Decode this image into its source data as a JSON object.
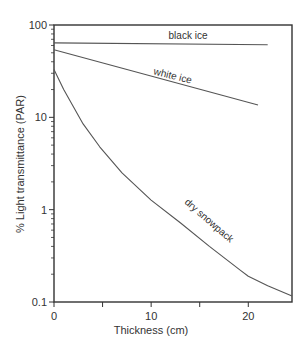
{
  "chart_data": {
    "type": "line",
    "title": "",
    "xlabel": "Thickness (cm)",
    "ylabel": "% Light transmittance (PAR)",
    "xlim": [
      0,
      24.5
    ],
    "ylim": [
      0.1,
      100
    ],
    "yscale": "log",
    "grid": false,
    "legend": "inline labels",
    "x_ticks": [
      0,
      10,
      20
    ],
    "x_minor_ticks": [
      5,
      15
    ],
    "y_ticks": [
      0.1,
      1,
      10,
      100
    ],
    "y_tick_labels": [
      "0.1",
      "1",
      "10",
      "100"
    ],
    "series": [
      {
        "name": "black ice",
        "x": [
          0,
          22
        ],
        "values": [
          64,
          61
        ]
      },
      {
        "name": "white ice",
        "x": [
          0,
          21
        ],
        "values": [
          54,
          13.6
        ]
      },
      {
        "name": "dry snowpack",
        "x": [
          0,
          1,
          2,
          3,
          4.7,
          7,
          10,
          13,
          16,
          19.2,
          20,
          22,
          24.5
        ],
        "values": [
          33,
          20,
          13,
          8.5,
          4.8,
          2.5,
          1.27,
          0.72,
          0.4,
          0.22,
          0.19,
          0.15,
          0.116
        ]
      }
    ]
  },
  "labels": {
    "xlabel": "Thickness (cm)",
    "ylabel": "% Light transmittance (PAR)",
    "black_ice": "black ice",
    "white_ice": "white ice",
    "dry_snowpack": "dry snowpack"
  },
  "colors": {
    "axis": "#333333",
    "line": "#555555"
  }
}
